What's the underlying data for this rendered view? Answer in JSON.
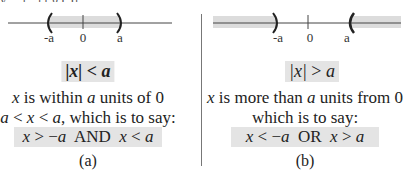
{
  "top_fragment": "y  ...  [ , ]  [    g    ( )]",
  "panel_a": {
    "number_line": {
      "labels": [
        "-a",
        "0",
        "a"
      ],
      "shaded": "between -a and a",
      "endpoints": [
        "(",
        ")"
      ],
      "shade_color": "#dcdcdc"
    },
    "condition": {
      "abs_x": "|x|",
      "op": "<",
      "var": "a"
    },
    "description": {
      "x": "x",
      "middle": " is within ",
      "a": "a",
      "rest": " units of 0"
    },
    "inequality": {
      "a1": "a",
      "lt1": " < ",
      "x": "x",
      "lt2": " < ",
      "a2": "a",
      "rest": ",  which is to say:"
    },
    "compound": {
      "x1": "x",
      "op1": " > −",
      "a1": "a",
      "conj": "  AND  ",
      "x2": "x",
      "op2": " < ",
      "a2": "a"
    },
    "caption": "(a)"
  },
  "panel_b": {
    "number_line": {
      "labels": [
        "-a",
        "0",
        "a"
      ],
      "shaded": "x < -a and x > a",
      "endpoints": [
        ")",
        "("
      ],
      "shade_color": "#dcdcdc"
    },
    "condition": {
      "abs_x": "|x|",
      "op": ">",
      "var": "a"
    },
    "description": {
      "x": "x",
      "middle": " is more than ",
      "a": "a",
      "rest": " units from 0"
    },
    "line2": "which is to say:",
    "compound": {
      "x1": "x",
      "op1": " < −",
      "a1": "a",
      "conj": "  OR  ",
      "x2": "x",
      "op2": " > ",
      "a2": "a"
    },
    "caption": "(b)"
  }
}
